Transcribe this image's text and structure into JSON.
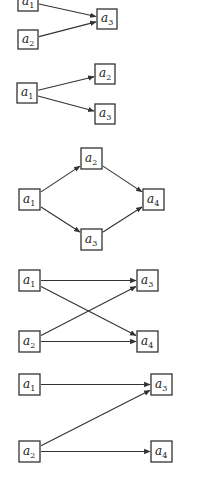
{
  "diagrams": [
    {
      "id": "d1",
      "nodes": [
        {
          "id": "a1",
          "label": "a",
          "sub": "1",
          "x": 18,
          "y": -8,
          "w": 20,
          "h": 19
        },
        {
          "id": "a2",
          "label": "a",
          "sub": "2",
          "x": 18,
          "y": 30,
          "w": 20,
          "h": 19
        },
        {
          "id": "a3",
          "label": "a",
          "sub": "3",
          "x": 97,
          "y": 9,
          "w": 20,
          "h": 20
        }
      ],
      "edges": [
        [
          "a1",
          "a3"
        ],
        [
          "a2",
          "a3"
        ]
      ]
    },
    {
      "id": "d2",
      "nodes": [
        {
          "id": "a1",
          "label": "a",
          "sub": "1",
          "x": 17,
          "y": 83,
          "w": 20,
          "h": 20
        },
        {
          "id": "a2",
          "label": "a",
          "sub": "2",
          "x": 95,
          "y": 64,
          "w": 20,
          "h": 20
        },
        {
          "id": "a3",
          "label": "a",
          "sub": "3",
          "x": 95,
          "y": 104,
          "w": 20,
          "h": 20
        }
      ],
      "edges": [
        [
          "a1",
          "a2"
        ],
        [
          "a1",
          "a3"
        ]
      ]
    },
    {
      "id": "d3",
      "nodes": [
        {
          "id": "a1",
          "label": "a",
          "sub": "1",
          "x": 19,
          "y": 189,
          "w": 21,
          "h": 21
        },
        {
          "id": "a2",
          "label": "a",
          "sub": "2",
          "x": 81,
          "y": 148,
          "w": 21,
          "h": 21
        },
        {
          "id": "a3",
          "label": "a",
          "sub": "3",
          "x": 81,
          "y": 229,
          "w": 21,
          "h": 21
        },
        {
          "id": "a4",
          "label": "a",
          "sub": "4",
          "x": 143,
          "y": 189,
          "w": 21,
          "h": 21
        }
      ],
      "edges": [
        [
          "a1",
          "a2"
        ],
        [
          "a1",
          "a3"
        ],
        [
          "a2",
          "a4"
        ],
        [
          "a3",
          "a4"
        ]
      ]
    },
    {
      "id": "d4",
      "nodes": [
        {
          "id": "a1",
          "label": "a",
          "sub": "1",
          "x": 19,
          "y": 270,
          "w": 21,
          "h": 21
        },
        {
          "id": "a2",
          "label": "a",
          "sub": "2",
          "x": 19,
          "y": 331,
          "w": 21,
          "h": 21
        },
        {
          "id": "a3",
          "label": "a",
          "sub": "3",
          "x": 137,
          "y": 270,
          "w": 21,
          "h": 21
        },
        {
          "id": "a4",
          "label": "a",
          "sub": "4",
          "x": 137,
          "y": 331,
          "w": 21,
          "h": 21
        }
      ],
      "edges": [
        [
          "a1",
          "a3"
        ],
        [
          "a1",
          "a4"
        ],
        [
          "a2",
          "a3"
        ],
        [
          "a2",
          "a4"
        ]
      ]
    },
    {
      "id": "d5",
      "nodes": [
        {
          "id": "a1",
          "label": "a",
          "sub": "1",
          "x": 19,
          "y": 374,
          "w": 21,
          "h": 21
        },
        {
          "id": "a2",
          "label": "a",
          "sub": "2",
          "x": 19,
          "y": 441,
          "w": 21,
          "h": 21
        },
        {
          "id": "a3",
          "label": "a",
          "sub": "3",
          "x": 151,
          "y": 374,
          "w": 21,
          "h": 21
        },
        {
          "id": "a4",
          "label": "a",
          "sub": "4",
          "x": 151,
          "y": 441,
          "w": 21,
          "h": 21
        }
      ],
      "edges": [
        [
          "a1",
          "a3"
        ],
        [
          "a2",
          "a3"
        ],
        [
          "a2",
          "a4"
        ]
      ]
    }
  ]
}
